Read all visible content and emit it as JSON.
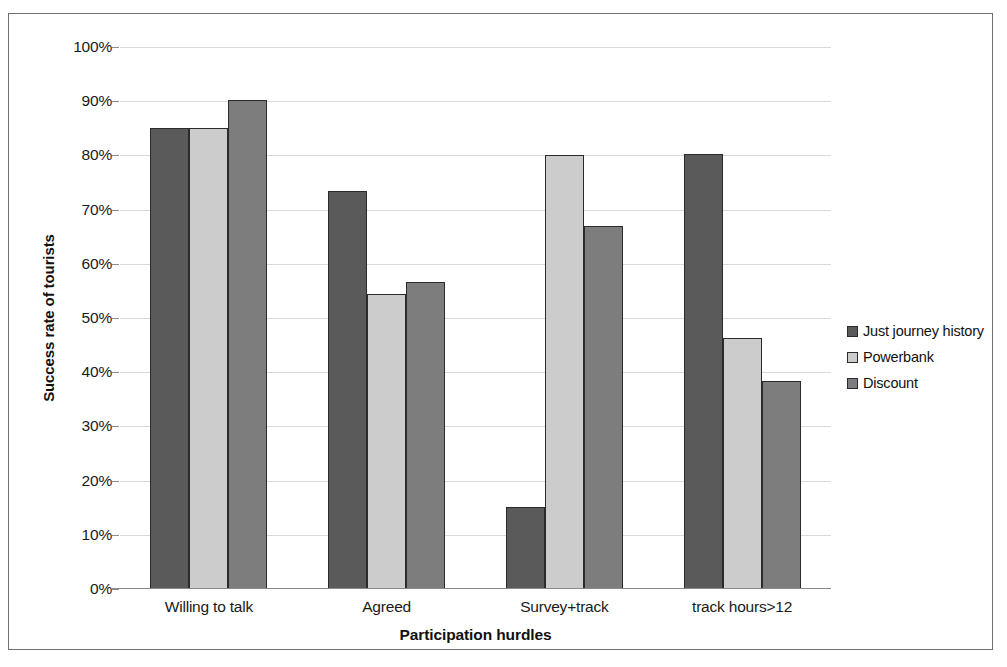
{
  "chart_data": {
    "type": "bar",
    "title": "",
    "xlabel": "Participation hurdles",
    "ylabel": "Success rate of tourists",
    "categories": [
      "Willing to talk",
      "Agreed",
      "Survey+track",
      "track hours>12"
    ],
    "series": [
      {
        "name": "Just journey history",
        "color": "#5a5a5a",
        "values": [
          85,
          73.5,
          15.2,
          80.2
        ]
      },
      {
        "name": "Powerbank",
        "color": "#cccccc",
        "values": [
          85,
          54.5,
          80,
          46.4
        ]
      },
      {
        "name": "Discount",
        "color": "#7d7d7d",
        "values": [
          90.2,
          56.7,
          67,
          38.4
        ]
      }
    ],
    "ylim": [
      0,
      100
    ],
    "ytick_labels": [
      "0%",
      "10%",
      "20%",
      "30%",
      "40%",
      "50%",
      "60%",
      "70%",
      "80%",
      "90%",
      "100%"
    ],
    "ytick_values": [
      0,
      10,
      20,
      30,
      40,
      50,
      60,
      70,
      80,
      90,
      100
    ],
    "grid": true,
    "legend_position": "right",
    "value_suffix": "%"
  },
  "axes": {
    "y_title": "Success rate of tourists",
    "x_title": "Participation hurdles"
  },
  "legend": {
    "entries": [
      {
        "label": "Just journey history",
        "color": "#5a5a5a"
      },
      {
        "label": "Powerbank",
        "color": "#cccccc"
      },
      {
        "label": "Discount",
        "color": "#7d7d7d"
      }
    ]
  }
}
